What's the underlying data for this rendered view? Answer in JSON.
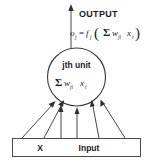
{
  "figure": {
    "background_color": "#ffffff",
    "stroke_color": "#303030",
    "text_color": "#1c1c1c"
  },
  "output": {
    "label": "OUTPUT",
    "formula": {
      "lhs_symbol": "o",
      "lhs_subscript": "j",
      "equals": "=",
      "function_symbol": "f",
      "function_subscript": "j",
      "open_paren": "(",
      "sum_symbol": "Σ",
      "weight_symbol": "w",
      "weight_subscript": "ji",
      "input_symbol": "x",
      "input_subscript": "i",
      "close_paren": ")",
      "plain_text": "o_j = f_j ( Σ w_ji x_i )"
    },
    "arrow": {
      "direction": "up",
      "name": "output-arrow"
    }
  },
  "unit": {
    "label": "jth unit",
    "body_formula": {
      "sum_symbol": "Σ",
      "weight_symbol": "w",
      "weight_subscript": "ji",
      "input_symbol": "x",
      "input_subscript": "i",
      "plain_text": "Σ w_ji x_i"
    },
    "shape": "circle"
  },
  "input_layer": {
    "shape": "rectangle",
    "labels": [
      {
        "text": "X",
        "name": "input-label-x"
      },
      {
        "text": "Input",
        "name": "input-label-input"
      }
    ],
    "connection_count": 6,
    "connections": [
      {
        "from_x": 22,
        "to_x": 50
      },
      {
        "from_x": 44,
        "to_x": 60
      },
      {
        "from_x": 60,
        "to_x": 69
      },
      {
        "from_x": 76,
        "to_x": 80
      },
      {
        "from_x": 98,
        "to_x": 92
      },
      {
        "from_x": 124,
        "to_x": 103
      }
    ]
  }
}
